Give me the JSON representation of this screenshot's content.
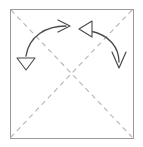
{
  "figure": {
    "type": "origami-fold-diagram",
    "title": "Square with diagonal fold lines and two rotation arrows",
    "canvas": {
      "width": 143,
      "height": 147,
      "background": "#ffffff"
    }
  },
  "colors": {
    "paper_fill": "#ffffff",
    "paper_border": "#9a9a9a",
    "fold_line": "#b5b5b5",
    "arrow_stroke": "#4a4a4a",
    "arrow_fill": "#ffffff"
  },
  "paper": {
    "label": "square sheet",
    "x": 10,
    "y": 9,
    "width": 123,
    "height": 129,
    "stroke_width": 1
  },
  "fold_lines": [
    {
      "name": "diagonal-top-left-to-bottom-right",
      "label": "valley fold diagonal",
      "x1": 11,
      "y1": 10,
      "x2": 132,
      "y2": 137,
      "style": "dashed",
      "dash": "5 4",
      "stroke_width": 1.1
    },
    {
      "name": "diagonal-top-right-to-bottom-left",
      "label": "valley fold diagonal",
      "x1": 132,
      "y1": 10,
      "x2": 11,
      "y2": 137,
      "style": "dashed",
      "dash": "5 4",
      "stroke_width": 1.1
    }
  ],
  "arrows": [
    {
      "name": "left-fold-arrow",
      "label": "fold left corner up and to the right",
      "path": "M 26,56 C 29,36 46,26 66,26",
      "stroke_width": 1.3,
      "tail_head": {
        "name": "hollow-triangle-head-down",
        "shape": "triangle-outline",
        "points": "17,58 35,58 26,70",
        "direction": "down",
        "filled": false
      },
      "tip_head": {
        "name": "open-v-head-right",
        "shape": "open-v",
        "points": "58,20 70,26 58,32",
        "direction": "right",
        "filled": false
      }
    },
    {
      "name": "right-fold-arrow",
      "label": "fold right corner down and to the left",
      "path": "M 90,31 C 110,35 119,48 119,62",
      "stroke_width": 1.3,
      "tail_head": {
        "name": "hollow-triangle-head-left",
        "shape": "triangle-outline",
        "points": "92,21 92,37 79,29",
        "direction": "left",
        "filled": false
      },
      "tip_head": {
        "name": "open-v-head-down",
        "shape": "open-v",
        "points": "112,52 119,68 126,52",
        "direction": "down",
        "filled": false
      }
    }
  ]
}
